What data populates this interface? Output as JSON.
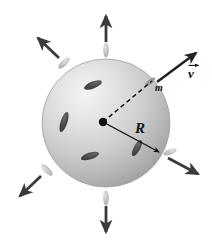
{
  "figure": {
    "background_color": "#ffffff",
    "width": 212,
    "height": 246
  },
  "sphere": {
    "name": "shaded-sphere",
    "center_x": 106,
    "center_y": 123,
    "radius": 64,
    "fill_light": "#f2f2f2",
    "fill_mid": "#cfcfcf",
    "fill_dark": "#a3a3a3",
    "edge_color": "#9a9a9a",
    "highlight_x": 78,
    "highlight_y": 92
  },
  "center_point": {
    "name": "sphere-center-dot",
    "x": 103,
    "y": 122,
    "radius": 4.2,
    "color": "#111111"
  },
  "radius_line": {
    "name": "radius-R",
    "label": "R",
    "x1": 103,
    "y1": 122,
    "x2": 159,
    "y2": 152,
    "color": "#111111",
    "style": "solid-with-arrowhead"
  },
  "mass_line": {
    "name": "mass-dashed-line",
    "label": "m",
    "x1": 103,
    "y1": 122,
    "x2": 154,
    "y2": 79,
    "color": "#111111",
    "style": "dashed"
  },
  "velocity_label": {
    "name": "velocity-vector-label",
    "symbol": "v",
    "has_overhead_arrow": true,
    "color": "#111111"
  },
  "velocity_arrow": {
    "name": "velocity-arrow",
    "x1": 157,
    "y1": 82,
    "x2": 196,
    "y2": 53,
    "color": "#222222",
    "width": 2.6
  },
  "radial_arrows": [
    {
      "name": "radial-arrow-up",
      "angle_deg": 270,
      "x1": 106,
      "y1": 42,
      "x2": 106,
      "y2": 16,
      "width": 2.8,
      "color": "#3a3a3a"
    },
    {
      "name": "radial-arrow-up-left",
      "angle_deg": 225,
      "x1": 59,
      "y1": 58,
      "x2": 38,
      "y2": 38,
      "width": 2.8,
      "color": "#3a3a3a"
    },
    {
      "name": "radial-arrow-down-left",
      "angle_deg": 135,
      "x1": 41,
      "y1": 176,
      "x2": 20,
      "y2": 196,
      "width": 2.8,
      "color": "#3a3a3a"
    },
    {
      "name": "radial-arrow-down",
      "angle_deg": 90,
      "x1": 106,
      "y1": 206,
      "x2": 106,
      "y2": 232,
      "width": 2.8,
      "color": "#3a3a3a"
    },
    {
      "name": "radial-arrow-down-right",
      "angle_deg": 27,
      "x1": 168,
      "y1": 158,
      "x2": 198,
      "y2": 174,
      "width": 2.8,
      "color": "#3a3a3a"
    }
  ],
  "escaping_particles": [
    {
      "name": "escaping-particle-up",
      "cx": 106,
      "cy": 50,
      "rx": 2.8,
      "ry": 7.5,
      "rotate": 0,
      "color": "#b9b9b9"
    },
    {
      "name": "escaping-particle-up-left",
      "cx": 64,
      "cy": 63,
      "rx": 2.8,
      "ry": 7.5,
      "rotate": 45,
      "color": "#b9b9b9"
    },
    {
      "name": "escaping-particle-down-left",
      "cx": 47,
      "cy": 170,
      "rx": 2.8,
      "ry": 7.5,
      "rotate": -45,
      "color": "#b9b9b9"
    },
    {
      "name": "escaping-particle-down",
      "cx": 106,
      "cy": 198,
      "rx": 2.8,
      "ry": 7.5,
      "rotate": 0,
      "color": "#b9b9b9"
    },
    {
      "name": "escaping-particle-down-right",
      "cx": 170,
      "cy": 152,
      "rx": 2.6,
      "ry": 7.0,
      "rotate": 70,
      "color": "#b9b9b9"
    },
    {
      "name": "escaping-particle-mass-m",
      "cx": 150,
      "cy": 82,
      "rx": 2.4,
      "ry": 6.5,
      "rotate": 50,
      "color": "#8e8e8e"
    }
  ],
  "surface_particles": [
    {
      "name": "surface-particle-1",
      "cx": 93,
      "cy": 85,
      "rx": 3.4,
      "ry": 9.5,
      "rotate": 68,
      "color": "#4a4a4a"
    },
    {
      "name": "surface-particle-2",
      "cx": 64,
      "cy": 122,
      "rx": 3.4,
      "ry": 10.5,
      "rotate": 18,
      "color": "#4a4a4a"
    },
    {
      "name": "surface-particle-3",
      "cx": 90,
      "cy": 156,
      "rx": 3.4,
      "ry": 9.5,
      "rotate": 72,
      "color": "#4a4a4a"
    },
    {
      "name": "surface-particle-4",
      "cx": 137,
      "cy": 148,
      "rx": 3.2,
      "ry": 9.0,
      "rotate": 28,
      "color": "#555555"
    }
  ]
}
